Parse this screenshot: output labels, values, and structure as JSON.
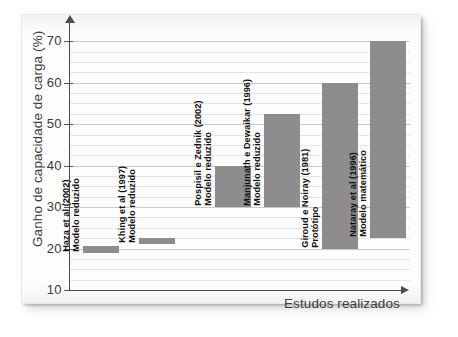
{
  "figure": {
    "background_color": "#ffffff",
    "page_color": "#fdfdfd",
    "bar_color": "#8d8d8d"
  },
  "chart_data": {
    "type": "bar",
    "subtype": "floating-range-bar",
    "title": "",
    "xlabel": "Estudos realizados",
    "ylabel": "Ganho de capacidade de carga (%)",
    "ylim": [
      10,
      72
    ],
    "ytick_labels": [
      "70",
      "60",
      "50",
      "40",
      "30",
      "20",
      "10"
    ],
    "yticks": [
      70,
      60,
      50,
      40,
      30,
      20,
      10
    ],
    "minor_gridline_step": 2.5,
    "grid": true,
    "legend": "none",
    "categories": [
      "Haza et al (2002) Modelo reduzido",
      "Khing et al (1997) Modelo reduzido",
      "Pospisil e Zednik (2002) Modelo reduzido",
      "Manjunath e Dewaikar (1996) Modelo reduzido",
      "Giroud e Noiray (1981) Protótipo",
      "Nataray et al (1996) Modelo matemático"
    ],
    "bars": [
      {
        "label_line1": "Haza et al (2002)",
        "label_line2": "Modelo reduzido",
        "low": 19.0,
        "high": 20.5
      },
      {
        "label_line1": "Khing et al (1997)",
        "label_line2": "Modelo reduzido",
        "low": 21.0,
        "high": 22.5
      },
      {
        "label_line1": "Pospisil e Zednik (2002)",
        "label_line2": "Modelo reduzido",
        "low": 30.0,
        "high": 40.0
      },
      {
        "label_line1": "Manjunath e Dewaikar (1996)",
        "label_line2": "Modelo reduzido",
        "low": 30.0,
        "high": 52.5
      },
      {
        "label_line1": "Giroud e Noiray (1981)",
        "label_line2": "Protótipo",
        "low": 20.0,
        "high": 60.0
      },
      {
        "label_line1": "Nataray et al (1996)",
        "label_line2": "Modelo matemático",
        "low": 22.5,
        "high": 70.0
      }
    ]
  }
}
